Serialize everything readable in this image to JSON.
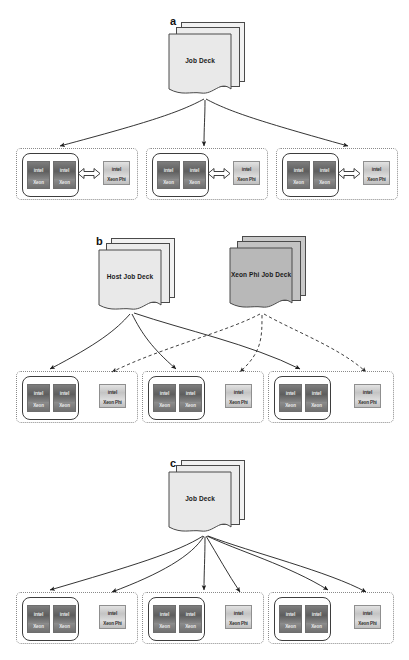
{
  "figure": {
    "background": "#ffffff",
    "width": 409,
    "height": 660
  },
  "colors": {
    "deck_fill_light": "#e9e9e9",
    "deck_fill_dark": "#b8b8b8",
    "stroke": "#3d3d3d",
    "dotted_group": "#8a8a8a",
    "cpu_body": "#6b6b6b",
    "phi_body": "#cfcfcf"
  },
  "panels": [
    {
      "id": "a",
      "label": "a",
      "decks": [
        {
          "name": "job-deck",
          "label": "Job Deck",
          "shade": "light"
        }
      ],
      "arrows": {
        "solid": 3,
        "dashed": 0,
        "targets": "host-boxes-only"
      },
      "nodes": [
        {
          "name": "compute-node-1",
          "host": {
            "cpus": [
              {
                "brand": "intel",
                "family": "Xeon"
              },
              {
                "brand": "intel",
                "family": "Xeon"
              }
            ]
          },
          "coprocessor": {
            "brand": "intel",
            "family": "Xeon Phi"
          },
          "link": "bidirectional",
          "phi_inside_host": true
        },
        {
          "name": "compute-node-2",
          "host": {
            "cpus": [
              {
                "brand": "intel",
                "family": "Xeon"
              },
              {
                "brand": "intel",
                "family": "Xeon"
              }
            ]
          },
          "coprocessor": {
            "brand": "intel",
            "family": "Xeon Phi"
          },
          "link": "bidirectional",
          "phi_inside_host": true
        },
        {
          "name": "compute-node-3",
          "host": {
            "cpus": [
              {
                "brand": "intel",
                "family": "Xeon"
              },
              {
                "brand": "intel",
                "family": "Xeon"
              }
            ]
          },
          "coprocessor": {
            "brand": "intel",
            "family": "Xeon Phi"
          },
          "link": "bidirectional",
          "phi_inside_host": true
        }
      ]
    },
    {
      "id": "b",
      "label": "b",
      "decks": [
        {
          "name": "host-job-deck",
          "label": "Host Job Deck",
          "shade": "light"
        },
        {
          "name": "xeon-phi-job-deck",
          "label": "Xeon Phi Job Deck",
          "shade": "dark"
        }
      ],
      "arrows": {
        "solid": 3,
        "dashed": 3,
        "targets": "hosts-solid-phis-dashed"
      },
      "nodes": [
        {
          "name": "compute-node-1",
          "host": {
            "cpus": [
              {
                "brand": "intel",
                "family": "Xeon"
              },
              {
                "brand": "intel",
                "family": "Xeon"
              }
            ]
          },
          "coprocessor": {
            "brand": "intel",
            "family": "Xeon Phi"
          },
          "link": "none",
          "phi_inside_host": false
        },
        {
          "name": "compute-node-2",
          "host": {
            "cpus": [
              {
                "brand": "intel",
                "family": "Xeon"
              },
              {
                "brand": "intel",
                "family": "Xeon"
              }
            ]
          },
          "coprocessor": {
            "brand": "intel",
            "family": "Xeon Phi"
          },
          "link": "none",
          "phi_inside_host": false
        },
        {
          "name": "compute-node-3",
          "host": {
            "cpus": [
              {
                "brand": "intel",
                "family": "Xeon"
              },
              {
                "brand": "intel",
                "family": "Xeon"
              }
            ]
          },
          "coprocessor": {
            "brand": "intel",
            "family": "Xeon Phi"
          },
          "link": "none",
          "phi_inside_host": false
        }
      ]
    },
    {
      "id": "c",
      "label": "c",
      "decks": [
        {
          "name": "job-deck",
          "label": "Job Deck",
          "shade": "light"
        }
      ],
      "arrows": {
        "solid": 6,
        "dashed": 0,
        "targets": "hosts-and-phis"
      },
      "nodes": [
        {
          "name": "compute-node-1",
          "host": {
            "cpus": [
              {
                "brand": "intel",
                "family": "Xeon"
              },
              {
                "brand": "intel",
                "family": "Xeon"
              }
            ]
          },
          "coprocessor": {
            "brand": "intel",
            "family": "Xeon Phi"
          },
          "link": "none",
          "phi_inside_host": false
        },
        {
          "name": "compute-node-2",
          "host": {
            "cpus": [
              {
                "brand": "intel",
                "family": "Xeon"
              },
              {
                "brand": "intel",
                "family": "Xeon"
              }
            ]
          },
          "coprocessor": {
            "brand": "intel",
            "family": "Xeon Phi"
          },
          "link": "none",
          "phi_inside_host": false
        },
        {
          "name": "compute-node-3",
          "host": {
            "cpus": [
              {
                "brand": "intel",
                "family": "Xeon"
              },
              {
                "brand": "intel",
                "family": "Xeon"
              }
            ]
          },
          "coprocessor": {
            "brand": "intel",
            "family": "Xeon Phi"
          },
          "link": "none",
          "phi_inside_host": false
        }
      ]
    }
  ],
  "labels": {
    "panel_a": "a",
    "panel_b": "b",
    "panel_c": "c",
    "job_deck": "Job Deck",
    "host_job_deck": "Host Job Deck",
    "xeon_phi_job_deck": "Xeon Phi Job Deck",
    "cpu_brand": "intel",
    "cpu_family": "Xeon",
    "phi_brand": "intel",
    "phi_family": "Xeon Phi"
  }
}
